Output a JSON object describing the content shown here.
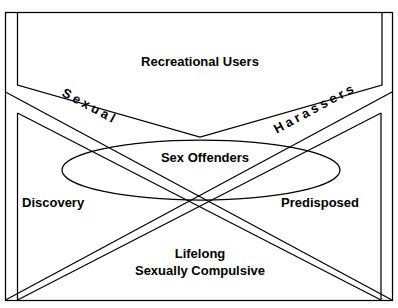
{
  "figure": {
    "title_partial": "",
    "canvas": {
      "width": 398,
      "height": 308,
      "background": "#ffffff"
    },
    "line_color": "#000000",
    "text_color": "#000000"
  },
  "regions": {
    "top_band": {
      "label": "Recreational Users"
    },
    "left_wedge": {
      "label": "Sexual"
    },
    "right_wedge": {
      "label": "Harassers"
    },
    "center_ellipse": {
      "label": "Sex Offenders"
    },
    "left_side": {
      "label": "Discovery"
    },
    "right_side": {
      "label": "Predisposed"
    },
    "bottom_wedge": {
      "label_line1": "Lifelong",
      "label_line2": "Sexually Compulsive"
    }
  }
}
